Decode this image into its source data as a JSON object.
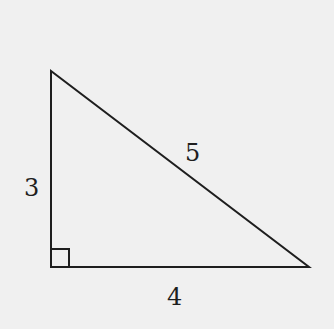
{
  "diagram": {
    "type": "right-triangle",
    "vertices": {
      "top_left": [
        51,
        71
      ],
      "bottom_left": [
        51,
        267
      ],
      "bottom_right": [
        309,
        267
      ]
    },
    "right_angle_marker": {
      "corner": "bottom_left",
      "size": 18
    },
    "labels": {
      "vertical_leg": "3",
      "hypotenuse": "5",
      "horizontal_leg": "4"
    },
    "colors": {
      "line": "#1e1e1e",
      "background": "#f0f0f0"
    }
  }
}
